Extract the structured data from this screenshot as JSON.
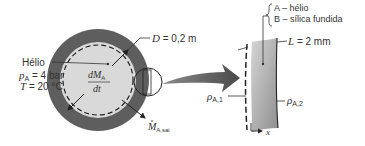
{
  "figure": {
    "tank": {
      "gas_label": "Hélio",
      "pressure_symbol": "p",
      "pressure_sub": "A",
      "pressure_value": " = 4 bar",
      "temperature_symbol": "T",
      "temperature_value": " = 20 °C",
      "diameter_symbol": "D",
      "diameter_value": " = 0,2 m",
      "rate_numerator": "dM",
      "rate_numerator_sub": "A",
      "rate_denominator": "dt",
      "outflow_symbol": "M",
      "outflow_sub": "A,sai"
    },
    "wall": {
      "species_a": "A – hélio",
      "species_b": "B – sílica fundida",
      "thickness_symbol": "L",
      "thickness_value": " = 2 mm",
      "rho_symbol": "ρ",
      "rho_inner_sub": "A,1",
      "rho_outer_sub": "A,2",
      "axis_label": "x"
    },
    "colors": {
      "shell": "#5a5a5a",
      "interior": "#d9d9d9",
      "arrow": "#555555",
      "slab_light": "#d8d8d8",
      "slab_dark": "#9a9a9a",
      "line": "#333333"
    }
  }
}
